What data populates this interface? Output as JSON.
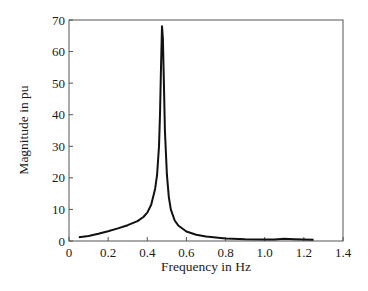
{
  "chart_data": {
    "type": "line",
    "title": "",
    "xlabel": "Frequency  in Hz",
    "ylabel": "Magnitude  in pu",
    "xlim": [
      0,
      1.4
    ],
    "ylim": [
      0,
      70
    ],
    "xticks": [
      "0",
      "0.2",
      "0.4",
      "0.6",
      "0.8",
      "1.0",
      "1.2",
      "1.4"
    ],
    "yticks": [
      "0",
      "10",
      "20",
      "30",
      "40",
      "50",
      "60",
      "70"
    ],
    "grid": false,
    "legend": null,
    "series": [
      {
        "name": "Magnitude",
        "color": "#111111",
        "x": [
          0.05,
          0.1,
          0.15,
          0.2,
          0.25,
          0.3,
          0.35,
          0.38,
          0.4,
          0.42,
          0.44,
          0.45,
          0.46,
          0.465,
          0.47,
          0.475,
          0.48,
          0.485,
          0.49,
          0.5,
          0.51,
          0.52,
          0.54,
          0.56,
          0.6,
          0.65,
          0.7,
          0.8,
          0.9,
          1.0,
          1.05,
          1.1,
          1.15,
          1.2,
          1.25
        ],
        "y": [
          1.2,
          1.6,
          2.3,
          3.1,
          4.0,
          5.0,
          6.3,
          7.6,
          9.0,
          11.5,
          16.5,
          21,
          30,
          40,
          55,
          68,
          64,
          50,
          35,
          21,
          14,
          10,
          6.5,
          4.8,
          3.0,
          2.0,
          1.4,
          0.8,
          0.55,
          0.45,
          0.5,
          0.7,
          0.55,
          0.45,
          0.4
        ]
      }
    ]
  }
}
